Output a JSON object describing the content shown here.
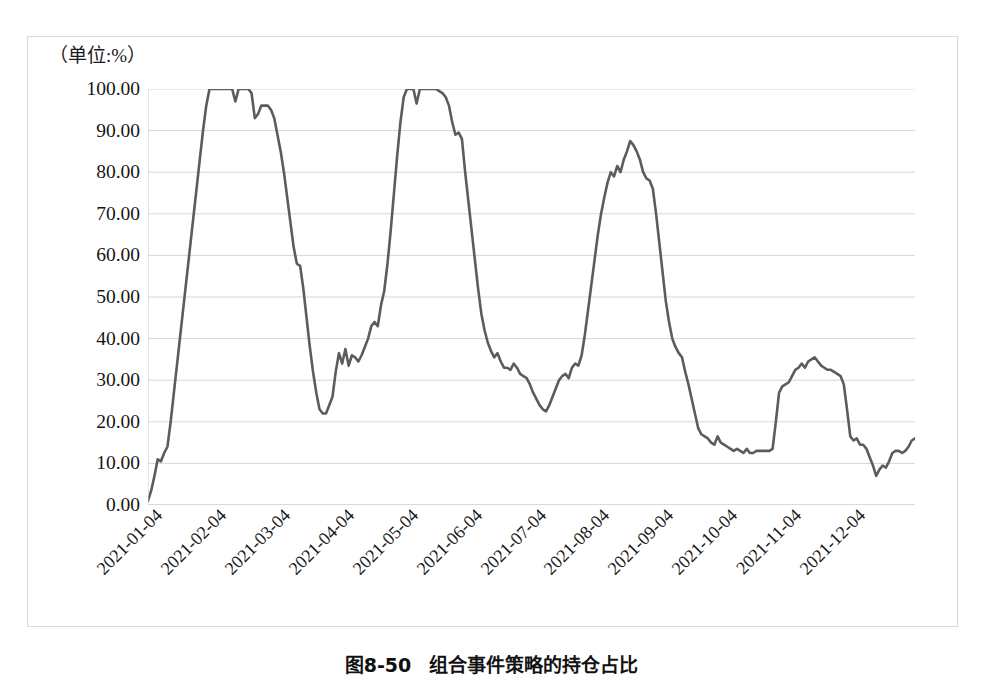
{
  "figure": {
    "unit_label": "（单位:%）",
    "caption_number": "图8-50",
    "caption_text": "组合事件策略的持仓占比"
  },
  "style": {
    "line_color": "#5c5c5c",
    "grid_color": "#d6d6d6",
    "frame_color": "#d9d9d9",
    "axis_color": "#c9c9c9",
    "text_color": "#161616"
  },
  "chart_data": {
    "type": "line",
    "title": "组合事件策略的持仓占比",
    "xlabel": "",
    "ylabel": "（单位:%）",
    "ylim": [
      0,
      100
    ],
    "ytick_labels": [
      "0.00",
      "10.00",
      "20.00",
      "30.00",
      "40.00",
      "50.00",
      "60.00",
      "70.00",
      "80.00",
      "90.00",
      "100.00"
    ],
    "ytick_values": [
      0,
      10,
      20,
      30,
      40,
      50,
      60,
      70,
      80,
      90,
      100
    ],
    "grid": true,
    "legend": false,
    "xtick_labels": [
      "2021-01-04",
      "2021-02-04",
      "2021-03-04",
      "2021-04-04",
      "2021-05-04",
      "2021-06-04",
      "2021-07-04",
      "2021-08-04",
      "2021-09-04",
      "2021-10-04",
      "2021-11-04",
      "2021-12-04"
    ],
    "xtick_positions": [
      0,
      63.9,
      127.8,
      191.8,
      255.7,
      319.6,
      383.5,
      447.4,
      511.3,
      575.3,
      639.2,
      703.1
    ],
    "series": [
      {
        "name": "持仓占比",
        "color": "#5c5c5c",
        "values": [
          1.0,
          3.5,
          7.0,
          11.0,
          10.5,
          12.5,
          14.0,
          20.0,
          27.0,
          34.0,
          41.0,
          48.0,
          55.0,
          62.0,
          69.0,
          76.0,
          83.0,
          90.0,
          96.0,
          100.0,
          100.0,
          100.0,
          100.0,
          100.0,
          100.0,
          100.0,
          100.0,
          97.0,
          100.0,
          100.0,
          100.0,
          100.0,
          99.0,
          93.0,
          94.0,
          96.0,
          96.0,
          96.0,
          95.0,
          93.0,
          89.0,
          85.0,
          80.0,
          74.0,
          68.0,
          62.0,
          58.0,
          57.5,
          52.0,
          45.0,
          38.0,
          32.0,
          27.0,
          23.0,
          22.0,
          22.0,
          24.0,
          26.0,
          32.0,
          36.5,
          34.0,
          37.5,
          33.5,
          36.0,
          35.5,
          34.5,
          36.0,
          38.0,
          40.0,
          43.0,
          44.0,
          43.0,
          48.0,
          51.5,
          58.0,
          66.0,
          75.0,
          84.0,
          92.0,
          98.0,
          100.0,
          100.0,
          100.0,
          96.5,
          100.0,
          100.0,
          100.0,
          100.0,
          100.0,
          100.0,
          99.5,
          99.0,
          98.0,
          96.0,
          92.0,
          89.0,
          89.5,
          88.0,
          80.0,
          73.0,
          66.0,
          59.0,
          52.0,
          46.0,
          42.0,
          39.0,
          37.0,
          35.5,
          36.5,
          34.5,
          33.0,
          33.0,
          32.5,
          34.0,
          33.0,
          31.5,
          31.0,
          30.5,
          29.0,
          27.0,
          25.5,
          24.0,
          23.0,
          22.5,
          24.0,
          26.0,
          28.0,
          30.0,
          31.0,
          31.5,
          30.5,
          33.0,
          34.0,
          33.5,
          36.0,
          41.0,
          47.0,
          53.0,
          59.0,
          65.0,
          70.0,
          74.0,
          77.5,
          80.0,
          79.0,
          81.5,
          80.0,
          83.0,
          85.0,
          87.5,
          86.5,
          85.0,
          83.0,
          80.0,
          78.5,
          78.0,
          76.0,
          70.0,
          63.0,
          56.0,
          49.0,
          44.0,
          40.0,
          38.0,
          36.5,
          35.5,
          32.0,
          29.0,
          25.5,
          22.0,
          18.5,
          17.0,
          16.5,
          16.0,
          15.0,
          14.5,
          16.5,
          15.0,
          14.5,
          14.0,
          13.5,
          13.0,
          13.5,
          13.0,
          12.5,
          13.5,
          12.5,
          12.5,
          13.0,
          13.0,
          13.0,
          13.0,
          13.0,
          13.5,
          20.0,
          27.0,
          28.5,
          29.0,
          29.5,
          31.0,
          32.5,
          33.0,
          34.0,
          33.0,
          34.5,
          35.0,
          35.5,
          34.5,
          33.5,
          33.0,
          32.5,
          32.5,
          32.0,
          31.5,
          31.0,
          29.0,
          23.0,
          16.5,
          15.5,
          16.0,
          14.5,
          14.5,
          13.5,
          11.5,
          9.5,
          7.0,
          8.5,
          9.5,
          9.0,
          10.5,
          12.5,
          13.0,
          13.0,
          12.5,
          13.0,
          14.0,
          15.5,
          16.0
        ]
      }
    ]
  }
}
